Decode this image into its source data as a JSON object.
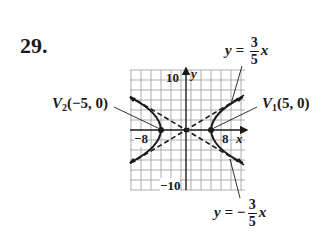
{
  "problem": {
    "number": "29."
  },
  "graph": {
    "y_tick_top": "10",
    "y_tick_bottom": "−10",
    "x_tick_left": "−8",
    "x_tick_right": "8",
    "x_axis_label": "x",
    "y_axis_label": "y",
    "grid_step_units": 2,
    "x_range": [
      -11.5,
      11.5
    ],
    "y_range": [
      -12,
      12
    ]
  },
  "annotations": {
    "v2": {
      "name": "V",
      "subscript": "2",
      "coords": "(−5, 0)"
    },
    "v1": {
      "name": "V",
      "subscript": "1",
      "coords": "(5, 0)"
    },
    "asymptote_pos": {
      "lhs": "y = ",
      "num": "3",
      "den": "5",
      "var": "x"
    },
    "asymptote_neg": {
      "lhs": "y = −",
      "num": "3",
      "den": "5",
      "var": "x"
    }
  },
  "colors": {
    "ink": "#1a1a1a",
    "grid": "#9a9a9a"
  }
}
